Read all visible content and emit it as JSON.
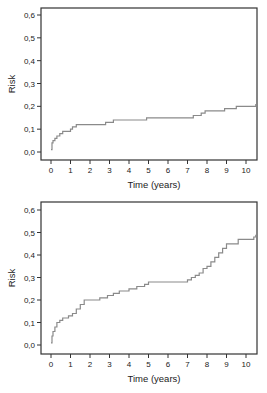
{
  "chart_data": [
    {
      "type": "line",
      "step": true,
      "title": "",
      "xlabel": "Time (years)",
      "ylabel": "Risk",
      "xlim": [
        0,
        10.5
      ],
      "ylim": [
        0.0,
        0.6
      ],
      "xticks": [
        "0",
        "1",
        "2",
        "3",
        "4",
        "5",
        "6",
        "7",
        "8",
        "9",
        "10"
      ],
      "yticks": [
        "0,0",
        "0,1",
        "0,2",
        "0,3",
        "0,4",
        "0,5",
        "0,6"
      ],
      "grid": false,
      "legend": null,
      "series": [
        {
          "name": "cumulative risk",
          "color": "#8a8a8a",
          "x": [
            0.0,
            0.05,
            0.1,
            0.2,
            0.3,
            0.45,
            0.6,
            0.8,
            1.0,
            1.1,
            1.3,
            2.8,
            3.2,
            4.9,
            7.3,
            7.7,
            7.9,
            8.9,
            9.5,
            10.5
          ],
          "y": [
            0.01,
            0.04,
            0.05,
            0.06,
            0.07,
            0.08,
            0.09,
            0.09,
            0.1,
            0.11,
            0.12,
            0.13,
            0.14,
            0.15,
            0.16,
            0.17,
            0.18,
            0.19,
            0.2,
            0.21
          ]
        }
      ]
    },
    {
      "type": "line",
      "step": true,
      "title": "",
      "xlabel": "Time (years)",
      "ylabel": "Risk",
      "xlim": [
        0,
        10.5
      ],
      "ylim": [
        0.0,
        0.6
      ],
      "xticks": [
        "0",
        "1",
        "2",
        "3",
        "4",
        "5",
        "6",
        "7",
        "8",
        "9",
        "10"
      ],
      "yticks": [
        "0,0",
        "0,1",
        "0,2",
        "0,3",
        "0,4",
        "0,5",
        "0,6"
      ],
      "grid": false,
      "legend": null,
      "series": [
        {
          "name": "cumulative risk",
          "color": "#8a8a8a",
          "x": [
            0.0,
            0.05,
            0.1,
            0.2,
            0.3,
            0.45,
            0.6,
            0.9,
            1.1,
            1.3,
            1.5,
            1.7,
            2.5,
            2.9,
            3.2,
            3.5,
            4.0,
            4.4,
            4.8,
            5.0,
            7.0,
            7.2,
            7.4,
            7.6,
            7.8,
            8.0,
            8.2,
            8.4,
            8.6,
            8.8,
            9.0,
            9.6,
            10.4,
            10.5
          ],
          "y": [
            0.01,
            0.04,
            0.06,
            0.08,
            0.1,
            0.11,
            0.12,
            0.13,
            0.14,
            0.16,
            0.18,
            0.2,
            0.21,
            0.22,
            0.23,
            0.24,
            0.25,
            0.26,
            0.27,
            0.28,
            0.29,
            0.3,
            0.31,
            0.32,
            0.34,
            0.35,
            0.37,
            0.39,
            0.41,
            0.43,
            0.45,
            0.47,
            0.48,
            0.49
          ]
        }
      ]
    }
  ]
}
